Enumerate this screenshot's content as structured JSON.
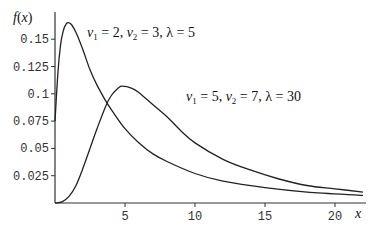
{
  "chart_data": {
    "type": "line",
    "title": "",
    "xlabel": "x",
    "ylabel": "f(x)",
    "xlim": [
      0,
      22
    ],
    "ylim": [
      0,
      0.17
    ],
    "grid": false,
    "x_ticks": [
      5,
      10,
      15,
      20
    ],
    "x_tick_labels": [
      "5",
      "10",
      "15",
      "20"
    ],
    "y_ticks": [
      0.025,
      0.05,
      0.075,
      0.1,
      0.125,
      0.15
    ],
    "y_tick_labels": [
      "0.025",
      "0.05",
      "0.075",
      "0.1",
      "0.125",
      "0.15"
    ],
    "series": [
      {
        "name": "ν1 = 2, ν2 = 3, λ = 5",
        "annotation": "ν1 = 2, ν2 = 3, λ = 5",
        "x": [
          0,
          0.2,
          0.4,
          0.6,
          0.8,
          1.0,
          1.2,
          1.5,
          2,
          2.5,
          3,
          3.6,
          4,
          5,
          6,
          7,
          8,
          10,
          12,
          15,
          18,
          22
        ],
        "y": [
          0.075,
          0.118,
          0.145,
          0.158,
          0.164,
          0.165,
          0.163,
          0.156,
          0.14,
          0.122,
          0.108,
          0.094,
          0.086,
          0.068,
          0.055,
          0.045,
          0.038,
          0.027,
          0.02,
          0.014,
          0.01,
          0.007
        ]
      },
      {
        "name": "ν1 = 5, ν2 = 7, λ = 30",
        "annotation": "ν1 = 5, ν2 = 7, λ = 30",
        "x": [
          0,
          0.5,
          1,
          1.5,
          2,
          2.5,
          3,
          3.6,
          4,
          4.5,
          4.8,
          5.5,
          6,
          7,
          8,
          9,
          10,
          12,
          14,
          16,
          18,
          20,
          22
        ],
        "y": [
          0,
          0.001,
          0.006,
          0.016,
          0.032,
          0.05,
          0.068,
          0.088,
          0.098,
          0.105,
          0.107,
          0.105,
          0.101,
          0.09,
          0.079,
          0.066,
          0.055,
          0.04,
          0.03,
          0.022,
          0.016,
          0.013,
          0.01
        ]
      }
    ]
  },
  "labels": {
    "y_axis": "f(x)",
    "x_axis": "x",
    "curve1": {
      "nu1": "2",
      "nu2": "3",
      "lambda": "5"
    },
    "curve2": {
      "nu1": "5",
      "nu2": "7",
      "lambda": "30"
    }
  }
}
